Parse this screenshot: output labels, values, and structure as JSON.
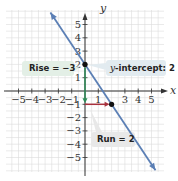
{
  "chart_data": {
    "type": "line",
    "title": "",
    "xlabel": "x",
    "ylabel": "y",
    "xlim": [
      -5.5,
      5.8
    ],
    "ylim": [
      -6.0,
      6.2
    ],
    "grid": true,
    "x_ticks": [
      -5,
      -4,
      -3,
      -2,
      -1,
      1,
      3,
      4,
      5
    ],
    "x_tick_labels": [
      "−5",
      "−4",
      "−3",
      "−2",
      "−1",
      "1",
      "3",
      "4",
      "5"
    ],
    "y_ticks": [
      5,
      4,
      3,
      2,
      1,
      -1,
      -2,
      -3,
      -4,
      -5
    ],
    "y_tick_labels": [
      "5",
      "4",
      "3",
      "2",
      "1",
      "−1",
      "−2",
      "−3",
      "−4",
      "−5"
    ],
    "series": [
      {
        "name": "line",
        "equation": "y = -3/2 x + 2",
        "slope": -1.5,
        "intercept": 2,
        "x": [
          -2.6,
          5.3
        ],
        "y": [
          5.9,
          -5.95
        ],
        "color": "#5b7fb5"
      }
    ],
    "points": [
      {
        "x": 0,
        "y": 2,
        "label": "y-intercept"
      },
      {
        "x": 2,
        "y": -1,
        "label": "point after rise and run"
      }
    ],
    "annotations": [
      {
        "text": "Rise = −3",
        "type": "rise",
        "from": [
          0,
          2
        ],
        "to": [
          0,
          -1
        ],
        "color": "#2e8b57"
      },
      {
        "text": "y-intercept: 2",
        "type": "callout",
        "target": [
          0,
          2
        ]
      },
      {
        "text": "Run = 2",
        "type": "run",
        "from": [
          0,
          -1
        ],
        "to": [
          2,
          -1
        ],
        "color": "#a0303a"
      }
    ]
  },
  "labels": {
    "x_axis": "x",
    "y_axis": "y",
    "rise": "Rise = −3",
    "intercept_var": "y",
    "intercept_rest": "-intercept: 2",
    "run": "Run = 2"
  },
  "colors": {
    "line": "#5b7fb5",
    "rise_arrow": "#2e8b57",
    "run_arrow": "#a8323e",
    "rise_callout_bg": "#e3efe6",
    "intercept_callout_bg": "#e2ebf0",
    "run_callout_bg": "#e8e8e8",
    "grid": "#dcdcdc",
    "axis": "#333333"
  }
}
